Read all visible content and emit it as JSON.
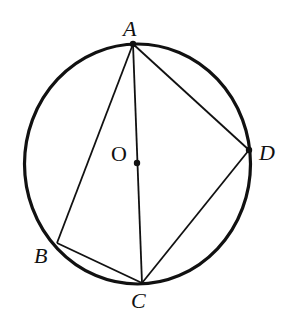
{
  "diagram": {
    "type": "circle-inscribed-quadrilateral",
    "circle": {
      "center_label": "O",
      "cx": 137.5,
      "cy": 164,
      "rx": 113,
      "ry": 120
    },
    "points": {
      "A": {
        "label": "A",
        "x": 133,
        "y": 44
      },
      "B": {
        "label": "B",
        "x": 57,
        "y": 243
      },
      "C": {
        "label": "C",
        "x": 142,
        "y": 283
      },
      "D": {
        "label": "D",
        "x": 249,
        "y": 150
      },
      "O": {
        "label": "O",
        "x": 137,
        "y": 163
      }
    },
    "segments": [
      "AB",
      "BC",
      "CD",
      "DA",
      "AC"
    ],
    "stroke_color": "#111111"
  }
}
